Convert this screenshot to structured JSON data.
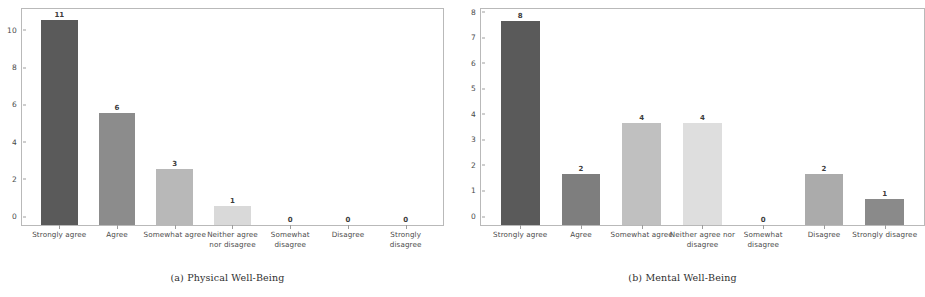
{
  "figure": {
    "panels": [
      {
        "id": "panel-a",
        "caption": "(a) Physical Well-Being",
        "chart_data": {
          "type": "bar",
          "title": "",
          "xlabel": "",
          "ylabel": "",
          "ylim": [
            0,
            11.6
          ],
          "grid": false,
          "legend": false,
          "yticks": [
            "0",
            "2",
            "4",
            "6",
            "8",
            "10"
          ],
          "ytick_values": [
            0,
            2,
            4,
            6,
            8,
            10
          ],
          "categories": [
            "Strongly agree",
            "Agree",
            "Somewhat agree",
            "Neither agree nor disagree",
            "Somewhat disagree",
            "Disagree",
            "Strongly disagree"
          ],
          "values": [
            11,
            6,
            3,
            1,
            0,
            0,
            0
          ],
          "value_labels": [
            "11",
            "6",
            "3",
            "1",
            "0",
            "0",
            "0"
          ],
          "bar_colors": [
            "#5a5a5a",
            "#8c8c8c",
            "#b8b8b8",
            "#d9d9d9",
            "#bdbdbd",
            "#a5a5a5",
            "#8f8f8f"
          ]
        }
      },
      {
        "id": "panel-b",
        "caption": "(b) Mental Well-Being",
        "chart_data": {
          "type": "bar",
          "title": "",
          "xlabel": "",
          "ylabel": "",
          "ylim": [
            0,
            8.45
          ],
          "grid": false,
          "legend": false,
          "yticks": [
            "0",
            "1",
            "2",
            "3",
            "4",
            "5",
            "6",
            "7",
            "8"
          ],
          "ytick_values": [
            0,
            1,
            2,
            3,
            4,
            5,
            6,
            7,
            8
          ],
          "categories": [
            "Strongly agree",
            "Agree",
            "Somewhat agree",
            "Neither agree nor disagree",
            "Somewhat disagree",
            "Disagree",
            "Strongly disagree"
          ],
          "values": [
            8,
            2,
            4,
            4,
            0,
            2,
            1
          ],
          "value_labels": [
            "8",
            "2",
            "4",
            "4",
            "0",
            "2",
            "1"
          ],
          "bar_colors": [
            "#5a5a5a",
            "#7e7e7e",
            "#c0c0c0",
            "#dedede",
            "#c8c8c8",
            "#ababab",
            "#8a8a8a"
          ]
        }
      }
    ]
  },
  "colors": {
    "axis": "#b9b9b9",
    "tick": "#9d9d9d",
    "text": "#4a4a4a",
    "caption_text": "#2f2f2f",
    "background": "#ffffff"
  }
}
